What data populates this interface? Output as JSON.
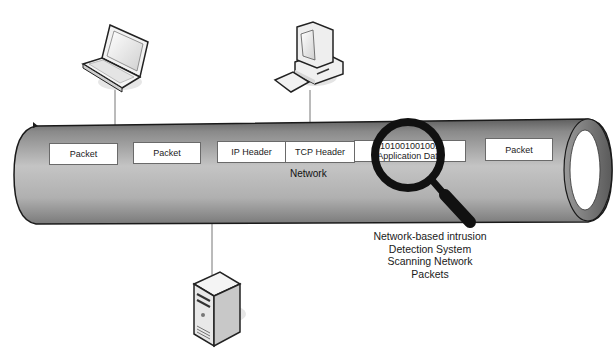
{
  "diagram": {
    "title": "Network-based intrusion detection",
    "network_label": "Network",
    "devices": [
      {
        "id": "laptop",
        "icon": "laptop-icon"
      },
      {
        "id": "desktop",
        "icon": "desktop-computer-icon"
      },
      {
        "id": "server",
        "icon": "server-tower-icon"
      }
    ],
    "packets": [
      {
        "label": "Packet"
      },
      {
        "label": "Packet"
      },
      {
        "label": "IP Header"
      },
      {
        "label": "TCP Header"
      },
      {
        "line1": "101001001001",
        "line2": "Application Data"
      },
      {
        "label": "Packet"
      }
    ],
    "magnifier": {
      "icon": "magnifying-glass-icon"
    },
    "caption": [
      "Network-based intrusion",
      "Detection System",
      "Scanning Network",
      "Packets"
    ],
    "colors": {
      "pipe_light": "#c8c8c8",
      "pipe_dark": "#6e6e6e",
      "outline": "#1a1a1a",
      "packet_bg": "#ffffff"
    }
  }
}
